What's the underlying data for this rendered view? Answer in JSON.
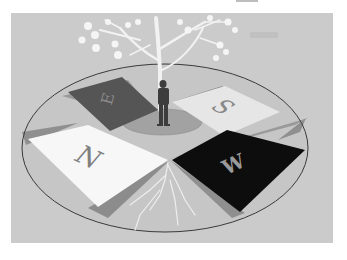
{
  "illustration": {
    "description": "3D rendering of a compass floor with cardinal direction tiles, a man standing at the center and a tree growing through",
    "panel_color": "#c9c9c9",
    "ellipse_color": "#3a3a3a",
    "tiles": [
      {
        "id": "north",
        "letter": "N",
        "fill": "#f7f7f7",
        "letter_color": "#808080"
      },
      {
        "id": "east",
        "letter": "E",
        "fill": "#555555",
        "letter_color": "#8a8a8a"
      },
      {
        "id": "south",
        "letter": "S",
        "fill": "#e6e6e6",
        "letter_color": "#888888"
      },
      {
        "id": "west",
        "letter": "W",
        "fill": "#0d0d0d",
        "letter_color": "#9a9a9a"
      }
    ],
    "figure": {
      "type": "man",
      "color": "#3d3d3d"
    },
    "tree": {
      "color": "#f2f2f2"
    }
  }
}
